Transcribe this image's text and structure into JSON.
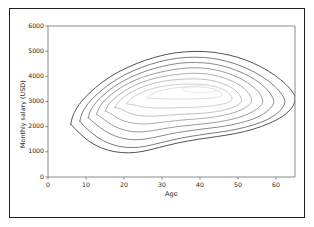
{
  "chart_data": {
    "type": "line",
    "subtype": "contour-kde",
    "title": "",
    "subtitle": "",
    "xlabel": "Age",
    "ylabel": "Monthly salary (USD)",
    "xlim": [
      0,
      65
    ],
    "ylim": [
      0,
      6000
    ],
    "xticks": [
      0,
      10,
      20,
      30,
      40,
      50,
      60
    ],
    "xtick_labels": [
      "0",
      "10",
      "20",
      "30",
      "40",
      "50",
      "60"
    ],
    "yticks": [
      0,
      1000,
      2000,
      3000,
      4000,
      5000,
      6000
    ],
    "ytick_labels": [
      "0",
      "1000",
      "2000",
      "3000",
      "4000",
      "5000",
      "6000"
    ],
    "grid": false,
    "legend": null,
    "annotations": [],
    "n_levels": 9,
    "mode": {
      "x": 41,
      "y": 3600
    },
    "level_colors": [
      "#4a4a4a",
      "#595959",
      "#6b6b6b",
      "#818181",
      "#999999",
      "#b0b0b0",
      "#c4c4c4",
      "#d6d6d6",
      "#e2e2e2"
    ],
    "contours": [
      {
        "level_index": 0,
        "density": 0.05,
        "points": [
          [
            6.0,
            2100
          ],
          [
            6.6,
            2450
          ],
          [
            8.2,
            2880
          ],
          [
            10.8,
            3320
          ],
          [
            14.4,
            3780
          ],
          [
            18.6,
            4180
          ],
          [
            23.2,
            4500
          ],
          [
            28.2,
            4760
          ],
          [
            33.4,
            4930
          ],
          [
            38.4,
            4990
          ],
          [
            43.2,
            4960
          ],
          [
            47.8,
            4840
          ],
          [
            52.0,
            4650
          ],
          [
            56.0,
            4380
          ],
          [
            59.6,
            4050
          ],
          [
            62.6,
            3680
          ],
          [
            64.6,
            3320
          ],
          [
            65.0,
            3080
          ],
          [
            64.2,
            2760
          ],
          [
            61.8,
            2420
          ],
          [
            58.2,
            2130
          ],
          [
            54.0,
            1900
          ],
          [
            49.4,
            1730
          ],
          [
            44.6,
            1610
          ],
          [
            39.6,
            1500
          ],
          [
            34.4,
            1360
          ],
          [
            29.4,
            1180
          ],
          [
            25.0,
            1020
          ],
          [
            21.2,
            960
          ],
          [
            17.4,
            1010
          ],
          [
            14.0,
            1160
          ],
          [
            11.0,
            1400
          ],
          [
            8.6,
            1700
          ],
          [
            6.9,
            1950
          ],
          [
            6.0,
            2100
          ]
        ]
      },
      {
        "level_index": 1,
        "density": 0.1,
        "points": [
          [
            8.4,
            2230
          ],
          [
            9.0,
            2540
          ],
          [
            10.5,
            2910
          ],
          [
            13.0,
            3300
          ],
          [
            16.3,
            3700
          ],
          [
            20.2,
            4060
          ],
          [
            24.6,
            4350
          ],
          [
            29.3,
            4580
          ],
          [
            34.1,
            4720
          ],
          [
            38.7,
            4760
          ],
          [
            43.0,
            4720
          ],
          [
            47.0,
            4600
          ],
          [
            50.8,
            4410
          ],
          [
            54.4,
            4160
          ],
          [
            57.6,
            3860
          ],
          [
            60.2,
            3520
          ],
          [
            61.9,
            3190
          ],
          [
            62.3,
            2960
          ],
          [
            61.4,
            2690
          ],
          [
            59.2,
            2410
          ],
          [
            56.0,
            2170
          ],
          [
            52.2,
            1990
          ],
          [
            48.0,
            1850
          ],
          [
            43.6,
            1750
          ],
          [
            39.0,
            1650
          ],
          [
            34.2,
            1520
          ],
          [
            29.6,
            1360
          ],
          [
            25.6,
            1220
          ],
          [
            22.1,
            1170
          ],
          [
            18.7,
            1220
          ],
          [
            15.7,
            1360
          ],
          [
            13.0,
            1580
          ],
          [
            10.8,
            1840
          ],
          [
            9.2,
            2070
          ],
          [
            8.4,
            2230
          ]
        ]
      },
      {
        "level_index": 2,
        "density": 0.18,
        "points": [
          [
            10.6,
            2360
          ],
          [
            11.2,
            2640
          ],
          [
            12.7,
            2970
          ],
          [
            15.0,
            3310
          ],
          [
            18.1,
            3660
          ],
          [
            21.7,
            3960
          ],
          [
            25.8,
            4210
          ],
          [
            30.2,
            4400
          ],
          [
            34.6,
            4520
          ],
          [
            38.8,
            4550
          ],
          [
            42.7,
            4510
          ],
          [
            46.3,
            4400
          ],
          [
            49.7,
            4230
          ],
          [
            52.9,
            4010
          ],
          [
            55.6,
            3750
          ],
          [
            57.8,
            3450
          ],
          [
            59.1,
            3160
          ],
          [
            59.4,
            2960
          ],
          [
            58.5,
            2730
          ],
          [
            56.5,
            2490
          ],
          [
            53.7,
            2290
          ],
          [
            50.3,
            2140
          ],
          [
            46.5,
            2020
          ],
          [
            42.5,
            1940
          ],
          [
            38.3,
            1860
          ],
          [
            33.9,
            1760
          ],
          [
            29.7,
            1630
          ],
          [
            26.1,
            1520
          ],
          [
            22.9,
            1480
          ],
          [
            19.9,
            1530
          ],
          [
            17.3,
            1650
          ],
          [
            14.9,
            1840
          ],
          [
            12.9,
            2060
          ],
          [
            11.4,
            2250
          ],
          [
            10.6,
            2360
          ]
        ]
      },
      {
        "level_index": 3,
        "density": 0.26,
        "points": [
          [
            12.8,
            2490
          ],
          [
            13.4,
            2730
          ],
          [
            14.8,
            3020
          ],
          [
            16.9,
            3310
          ],
          [
            19.8,
            3610
          ],
          [
            23.1,
            3860
          ],
          [
            26.9,
            4060
          ],
          [
            30.9,
            4210
          ],
          [
            35.0,
            4310
          ],
          [
            38.8,
            4340
          ],
          [
            42.3,
            4300
          ],
          [
            45.6,
            4200
          ],
          [
            48.6,
            4050
          ],
          [
            51.3,
            3860
          ],
          [
            53.6,
            3630
          ],
          [
            55.4,
            3380
          ],
          [
            56.3,
            3140
          ],
          [
            56.5,
            2970
          ],
          [
            55.6,
            2780
          ],
          [
            53.8,
            2590
          ],
          [
            51.3,
            2420
          ],
          [
            48.3,
            2290
          ],
          [
            44.9,
            2190
          ],
          [
            41.3,
            2120
          ],
          [
            37.5,
            2060
          ],
          [
            33.5,
            1990
          ],
          [
            29.7,
            1900
          ],
          [
            26.5,
            1820
          ],
          [
            23.6,
            1790
          ],
          [
            20.9,
            1840
          ],
          [
            18.6,
            1940
          ],
          [
            16.6,
            2090
          ],
          [
            14.9,
            2270
          ],
          [
            13.6,
            2410
          ],
          [
            12.8,
            2490
          ]
        ]
      },
      {
        "level_index": 4,
        "density": 0.36,
        "points": [
          [
            15.1,
            2620
          ],
          [
            15.7,
            2820
          ],
          [
            17.0,
            3060
          ],
          [
            19.0,
            3300
          ],
          [
            21.6,
            3550
          ],
          [
            24.6,
            3760
          ],
          [
            28.1,
            3920
          ],
          [
            31.7,
            4030
          ],
          [
            35.4,
            4100
          ],
          [
            38.9,
            4120
          ],
          [
            42.0,
            4090
          ],
          [
            44.9,
            4000
          ],
          [
            47.5,
            3870
          ],
          [
            49.8,
            3710
          ],
          [
            51.6,
            3520
          ],
          [
            52.9,
            3310
          ],
          [
            53.5,
            3120
          ],
          [
            53.5,
            2980
          ],
          [
            52.6,
            2830
          ],
          [
            51.0,
            2680
          ],
          [
            48.8,
            2550
          ],
          [
            46.1,
            2450
          ],
          [
            43.1,
            2370
          ],
          [
            39.9,
            2320
          ],
          [
            36.6,
            2280
          ],
          [
            33.1,
            2230
          ],
          [
            29.8,
            2170
          ],
          [
            27.0,
            2120
          ],
          [
            24.4,
            2110
          ],
          [
            22.0,
            2150
          ],
          [
            19.9,
            2230
          ],
          [
            18.2,
            2350
          ],
          [
            16.8,
            2490
          ],
          [
            15.7,
            2580
          ],
          [
            15.1,
            2620
          ]
        ]
      },
      {
        "level_index": 5,
        "density": 0.48,
        "points": [
          [
            17.6,
            2760
          ],
          [
            18.2,
            2920
          ],
          [
            19.4,
            3110
          ],
          [
            21.2,
            3300
          ],
          [
            23.5,
            3490
          ],
          [
            26.2,
            3650
          ],
          [
            29.3,
            3770
          ],
          [
            32.5,
            3850
          ],
          [
            35.7,
            3890
          ],
          [
            38.8,
            3900
          ],
          [
            41.6,
            3870
          ],
          [
            44.1,
            3800
          ],
          [
            46.3,
            3690
          ],
          [
            48.2,
            3560
          ],
          [
            49.6,
            3400
          ],
          [
            50.5,
            3230
          ],
          [
            50.9,
            3080
          ],
          [
            50.8,
            2970
          ],
          [
            50.0,
            2860
          ],
          [
            48.6,
            2760
          ],
          [
            46.7,
            2670
          ],
          [
            44.4,
            2600
          ],
          [
            41.8,
            2550
          ],
          [
            39.0,
            2520
          ],
          [
            36.1,
            2500
          ],
          [
            33.1,
            2470
          ],
          [
            30.3,
            2440
          ],
          [
            27.9,
            2420
          ],
          [
            25.7,
            2420
          ],
          [
            23.7,
            2450
          ],
          [
            22.0,
            2510
          ],
          [
            20.5,
            2600
          ],
          [
            19.3,
            2690
          ],
          [
            18.3,
            2740
          ],
          [
            17.6,
            2760
          ]
        ]
      },
      {
        "level_index": 6,
        "density": 0.62,
        "points": [
          [
            20.6,
            2900
          ],
          [
            21.2,
            3020
          ],
          [
            22.3,
            3160
          ],
          [
            23.9,
            3300
          ],
          [
            25.9,
            3430
          ],
          [
            28.2,
            3540
          ],
          [
            30.8,
            3620
          ],
          [
            33.5,
            3670
          ],
          [
            36.2,
            3690
          ],
          [
            38.8,
            3690
          ],
          [
            41.2,
            3670
          ],
          [
            43.3,
            3620
          ],
          [
            45.1,
            3540
          ],
          [
            46.6,
            3440
          ],
          [
            47.6,
            3330
          ],
          [
            48.2,
            3210
          ],
          [
            48.4,
            3110
          ],
          [
            48.2,
            3040
          ],
          [
            47.5,
            2970
          ],
          [
            46.3,
            2910
          ],
          [
            44.7,
            2860
          ],
          [
            42.8,
            2820
          ],
          [
            40.6,
            2790
          ],
          [
            38.2,
            2770
          ],
          [
            35.8,
            2760
          ],
          [
            33.3,
            2750
          ],
          [
            30.9,
            2740
          ],
          [
            28.8,
            2740
          ],
          [
            26.9,
            2750
          ],
          [
            25.2,
            2780
          ],
          [
            23.8,
            2820
          ],
          [
            22.6,
            2870
          ],
          [
            21.6,
            2890
          ],
          [
            20.9,
            2900
          ],
          [
            20.6,
            2900
          ]
        ]
      },
      {
        "level_index": 7,
        "density": 0.78,
        "points": [
          [
            26.0,
            3130
          ],
          [
            26.6,
            3220
          ],
          [
            27.6,
            3310
          ],
          [
            29.0,
            3400
          ],
          [
            30.7,
            3470
          ],
          [
            32.6,
            3520
          ],
          [
            34.6,
            3560
          ],
          [
            36.7,
            3580
          ],
          [
            38.7,
            3580
          ],
          [
            40.6,
            3570
          ],
          [
            42.3,
            3540
          ],
          [
            43.7,
            3490
          ],
          [
            44.8,
            3430
          ],
          [
            45.5,
            3360
          ],
          [
            45.8,
            3290
          ],
          [
            45.7,
            3230
          ],
          [
            45.2,
            3190
          ],
          [
            44.3,
            3160
          ],
          [
            43.1,
            3140
          ],
          [
            41.6,
            3120
          ],
          [
            39.9,
            3110
          ],
          [
            38.1,
            3100
          ],
          [
            36.2,
            3100
          ],
          [
            34.3,
            3100
          ],
          [
            32.5,
            3100
          ],
          [
            30.9,
            3110
          ],
          [
            29.5,
            3110
          ],
          [
            28.3,
            3120
          ],
          [
            27.3,
            3120
          ],
          [
            26.5,
            3130
          ],
          [
            26.0,
            3130
          ]
        ]
      },
      {
        "level_index": 8,
        "density": 0.92,
        "points": [
          [
            35.2,
            3490
          ],
          [
            36.4,
            3560
          ],
          [
            37.9,
            3610
          ],
          [
            39.5,
            3640
          ],
          [
            41.1,
            3650
          ],
          [
            42.6,
            3640
          ],
          [
            43.8,
            3610
          ],
          [
            44.7,
            3560
          ],
          [
            45.1,
            3510
          ],
          [
            45.0,
            3460
          ],
          [
            44.4,
            3420
          ],
          [
            43.4,
            3390
          ],
          [
            42.1,
            3370
          ],
          [
            40.6,
            3360
          ],
          [
            39.0,
            3360
          ],
          [
            37.5,
            3380
          ],
          [
            36.2,
            3410
          ],
          [
            35.4,
            3450
          ],
          [
            35.2,
            3490
          ]
        ]
      }
    ]
  },
  "figure": {
    "background": "#ffffff",
    "border_color": "#231f20",
    "axis_color": "#6e6e6e",
    "text_color": "#231f20"
  }
}
